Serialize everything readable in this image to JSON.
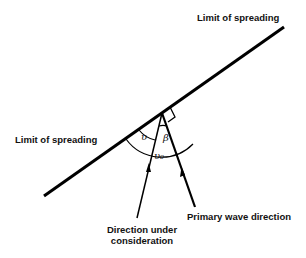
{
  "diagram": {
    "labels": {
      "limit_top": "Limit of spreading",
      "limit_left": "Limit of spreading",
      "direction_line1": "Direction under",
      "direction_line2": "consideration",
      "primary": "Primary wave direction"
    },
    "symbols": {
      "upsilon": "υ",
      "beta": "β",
      "upsilon_zero": "υ₀"
    },
    "colors": {
      "stroke": "#000000",
      "background": "#ffffff"
    }
  }
}
